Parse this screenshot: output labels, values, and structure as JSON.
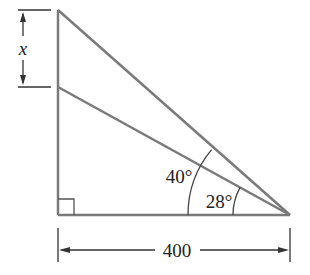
{
  "diagram": {
    "type": "geometry-right-triangle",
    "labels": {
      "x": "x",
      "angle_outer": "40°",
      "angle_inner": "28°",
      "base": "400"
    },
    "colors": {
      "stroke": "#7a7a7a",
      "text": "#222222",
      "dim": "#333333"
    }
  }
}
